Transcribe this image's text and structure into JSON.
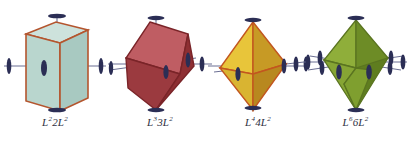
{
  "figure": {
    "background_color": "#ffffff",
    "width": 407,
    "height": 145,
    "axis_marker_color": "#2b2e55",
    "axis_line_color": "#6b6f93",
    "label_color": "#2f3042"
  },
  "items": [
    {
      "id": "prism",
      "shape_name": "hexagonal-prism",
      "label_full": "L²2L²",
      "label_parts": {
        "l1": "L",
        "sup1": "2",
        "count": "2",
        "l2": "L",
        "sup2": "2"
      },
      "colors": {
        "face_front": "#b9d6ce",
        "face_side": "#a8c9c1",
        "face_top": "#cde2dc",
        "edge": "#b4552e"
      },
      "axes": {
        "vertical_markers": 2,
        "horizontal_markers": 2,
        "interior_markers": 1
      }
    },
    {
      "id": "rhombohedron",
      "shape_name": "rhombohedron",
      "label_full": "L³3L²",
      "label_parts": {
        "l1": "L",
        "sup1": "3",
        "count": "3",
        "l2": "L",
        "sup2": "2"
      },
      "colors": {
        "face_front": "#bf5d63",
        "face_side": "#8e2f33",
        "face_top": "#a8414a",
        "face_lower": "#9b3a3f",
        "edge": "#7a2428"
      },
      "axes": {
        "vertical_markers": 2,
        "horizontal_markers": 3,
        "interior_markers": 1
      }
    },
    {
      "id": "tetragonal-bipyramid",
      "shape_name": "tetragonal-bipyramid",
      "label_full": "L⁴4L²",
      "label_parts": {
        "l1": "L",
        "sup1": "4",
        "count": "4",
        "l2": "L",
        "sup2": "2"
      },
      "colors": {
        "face_left": "#e8c53a",
        "face_right": "#c79a25",
        "face_lower_left": "#d9b431",
        "face_lower_right": "#b8881f",
        "edge": "#c2561f"
      },
      "axes": {
        "vertical_markers": 2,
        "horizontal_markers": 4,
        "interior_markers": 2
      }
    },
    {
      "id": "hexagonal-bipyramid",
      "shape_name": "hexagonal-bipyramid",
      "label_full": "L⁶6L²",
      "label_parts": {
        "l1": "L",
        "sup1": "6",
        "count": "6",
        "l2": "L",
        "sup2": "2"
      },
      "colors": {
        "face_left": "#8fae3a",
        "face_mid": "#7f9f2f",
        "face_right": "#6d8c26",
        "face_lower_left": "#86a534",
        "face_lower_right": "#5f7d1f",
        "edge": "#5a7420"
      },
      "axes": {
        "vertical_markers": 2,
        "horizontal_markers": 6,
        "interior_markers": 3
      }
    }
  ]
}
